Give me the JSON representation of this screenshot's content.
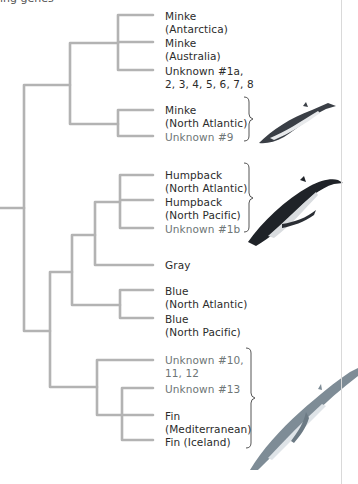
{
  "header": {
    "fragment": "ing genes"
  },
  "colors": {
    "branch": "#b3b3b3",
    "known_label": "#2b2b2b",
    "unknown_label": "#6e7676",
    "brace": "#555555",
    "minke_whale": "#3a3f46",
    "humpback_whale": "#1f2328",
    "fin_whale": "#7e8c96"
  },
  "tree": {
    "leaves": [
      {
        "id": "minke-antarctica",
        "label": "Minke\n(Antarctica)",
        "unknown": false
      },
      {
        "id": "minke-australia",
        "label": "Minke\n(Australia)",
        "unknown": false
      },
      {
        "id": "unknown-1a-8",
        "label": "Unknown #1a,\n2, 3, 4, 5, 6, 7, 8",
        "unknown": false
      },
      {
        "id": "minke-north-atlantic",
        "label": "Minke\n(North Atlantic)",
        "unknown": false
      },
      {
        "id": "unknown-9",
        "label": "Unknown #9",
        "unknown": true
      },
      {
        "id": "humpback-north-atlantic",
        "label": "Humpback\n(North Atlantic)",
        "unknown": false
      },
      {
        "id": "humpback-north-pacific",
        "label": "Humpback\n(North Pacific)",
        "unknown": false
      },
      {
        "id": "unknown-1b",
        "label": "Unknown #1b",
        "unknown": true
      },
      {
        "id": "gray",
        "label": "Gray",
        "unknown": false
      },
      {
        "id": "blue-north-atlantic",
        "label": "Blue\n(North Atlantic)",
        "unknown": false
      },
      {
        "id": "blue-north-pacific",
        "label": "Blue\n(North Pacific)",
        "unknown": false
      },
      {
        "id": "unknown-10-12",
        "label": "Unknown #10,\n11, 12",
        "unknown": true
      },
      {
        "id": "unknown-13",
        "label": "Unknown #13",
        "unknown": true
      },
      {
        "id": "fin-mediterranean",
        "label": "Fin\n(Mediterranean)",
        "unknown": false
      },
      {
        "id": "fin-iceland",
        "label": "Fin (Iceland)",
        "unknown": false
      }
    ],
    "groups": [
      {
        "name": "minke",
        "members": [
          "Minke (North Atlantic)",
          "Unknown #9"
        ],
        "illustration": "minke-whale"
      },
      {
        "name": "humpback",
        "members": [
          "Humpback (North Atlantic)",
          "Humpback (North Pacific)",
          "Unknown #1b"
        ],
        "illustration": "humpback-whale"
      },
      {
        "name": "fin",
        "members": [
          "Unknown #10, 11, 12",
          "Unknown #13",
          "Fin (Mediterranean)",
          "Fin (Iceland)"
        ],
        "illustration": "fin-whale"
      }
    ]
  }
}
